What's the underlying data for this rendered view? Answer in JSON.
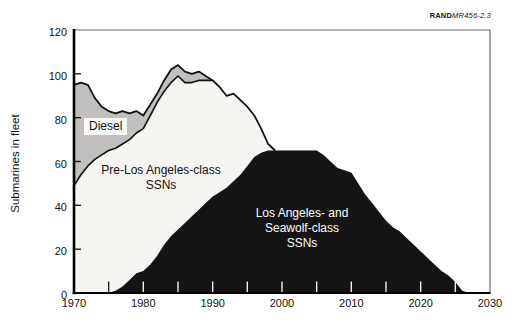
{
  "header": {
    "credit_bold": "RAND",
    "credit_italic": "MR456-2.3"
  },
  "chart_data": {
    "type": "area",
    "stacked": true,
    "title": "",
    "xlabel": "",
    "ylabel": "Submarines in fleet",
    "x_range": [
      1970,
      2030
    ],
    "ylim": [
      0,
      120
    ],
    "grid": false,
    "legend_position": "labels-on-areas",
    "x_start": 1970,
    "x_step": 1,
    "y_ticks": [
      0,
      20,
      40,
      60,
      80,
      100,
      120
    ],
    "x_tick_labels": [
      1970,
      1980,
      1990,
      2000,
      2010,
      2020,
      2030
    ],
    "x_minor_ticks": [
      1975,
      1980,
      1985,
      1990,
      1995,
      2000,
      2005,
      2010,
      2015,
      2020,
      2025
    ],
    "colors": {
      "diesel_fill": "#c1c0be",
      "pre_la_fill": "#f7f5f1",
      "la_fill": "#141414",
      "outline": "#111111",
      "frame": "#6b6b6b",
      "tick_over_black": "#ffffff"
    },
    "series": [
      {
        "name": "Los Angeles- and Seawolf-class SSNs",
        "stack_order": 0,
        "color": "#141414",
        "values": [
          0,
          0,
          0,
          0,
          0,
          0,
          1,
          3,
          6,
          9,
          10,
          13,
          17,
          22,
          26,
          29,
          32,
          35,
          38,
          41,
          44,
          46,
          48,
          51,
          54,
          58,
          62,
          64,
          65,
          65,
          65,
          65,
          65,
          65,
          65,
          65,
          63,
          60,
          57,
          56,
          55,
          50,
          45,
          41,
          37,
          33,
          30,
          28,
          25,
          22,
          19,
          16,
          13,
          10,
          8,
          5,
          1,
          0,
          0,
          0,
          0
        ]
      },
      {
        "name": "Pre-Los Angeles-class SSNs",
        "stack_order": 1,
        "color": "#f7f5f1",
        "values": [
          49,
          54,
          58,
          61,
          63,
          65,
          65,
          65,
          64,
          64,
          65,
          68,
          70,
          70,
          70,
          70,
          64,
          61,
          59,
          56,
          53,
          48,
          42,
          40,
          34,
          27,
          19,
          11,
          3,
          0,
          0,
          0,
          0,
          0,
          0,
          0,
          0,
          0,
          0,
          0,
          0,
          0,
          0,
          0,
          0,
          0,
          0,
          0,
          0,
          0,
          0,
          0,
          0,
          0,
          0,
          0,
          0,
          0,
          0,
          0,
          0
        ]
      },
      {
        "name": "Diesel",
        "stack_order": 2,
        "color": "#c1c0be",
        "values": [
          46,
          42,
          37,
          28,
          22,
          18,
          16,
          15,
          12,
          10,
          6,
          5,
          4,
          5,
          6,
          5,
          5,
          4,
          4,
          2,
          0,
          0,
          0,
          0,
          0,
          0,
          0,
          0,
          0,
          0,
          0,
          0,
          0,
          0,
          0,
          0,
          0,
          0,
          0,
          0,
          0,
          0,
          0,
          0,
          0,
          0,
          0,
          0,
          0,
          0,
          0,
          0,
          0,
          0,
          0,
          0,
          0,
          0,
          0,
          0,
          0
        ]
      }
    ],
    "area_labels": {
      "diesel": "Diesel",
      "pre_la": "Pre-Los Angeles-class\nSSNs",
      "la_seawolf": "Los Angeles- and\nSeawolf-class\nSSNs"
    }
  }
}
